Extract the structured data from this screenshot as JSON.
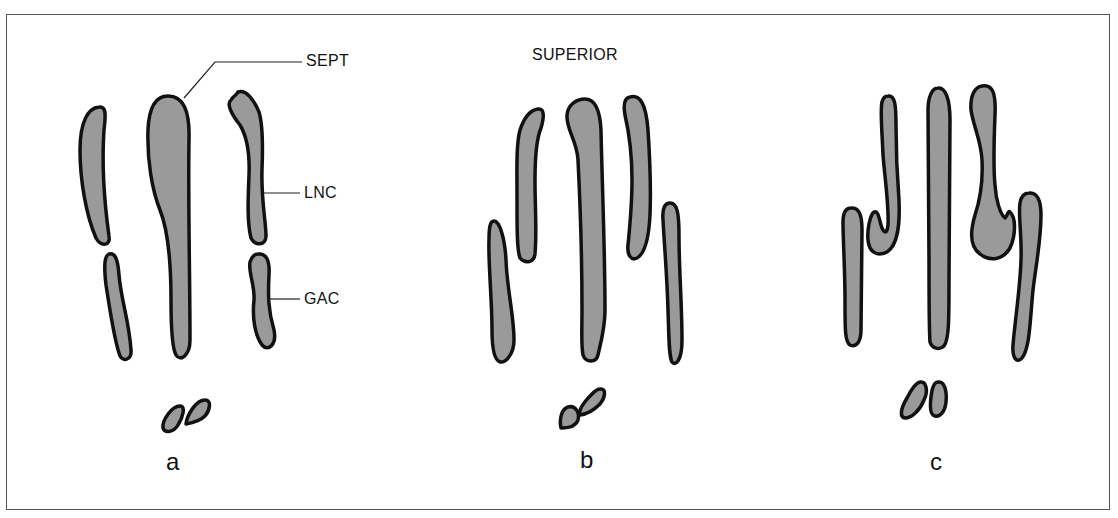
{
  "figure": {
    "panels": [
      {
        "id": "a",
        "label": "a"
      },
      {
        "id": "b",
        "label": "b"
      },
      {
        "id": "c",
        "label": "c"
      }
    ],
    "annotations": {
      "sept": "SEPT",
      "lnc": "LNC",
      "gac": "GAC",
      "orientation": "SUPERIOR"
    },
    "colors": {
      "fill": "#9a9a9a",
      "stroke": "#111111",
      "background": "#ffffff"
    }
  }
}
